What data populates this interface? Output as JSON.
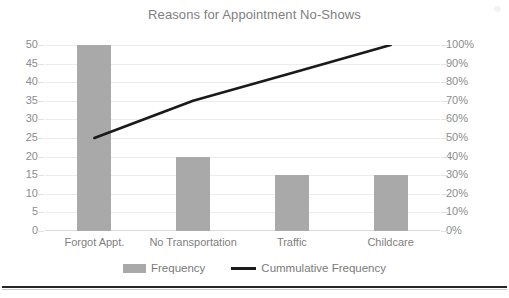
{
  "chart_data": {
    "type": "bar",
    "title": "Reasons for Appointment No-Shows",
    "xlabel": "",
    "ylabel": "",
    "categories": [
      "Forgot Appt.",
      "No Transportation",
      "Traffic",
      "Childcare"
    ],
    "series": [
      {
        "name": "Frequency",
        "type": "bar",
        "axis": "left",
        "values": [
          50,
          20,
          15,
          15
        ],
        "color": "#a9a9a9"
      },
      {
        "name": "Cummulative Frequency",
        "type": "line",
        "axis": "right",
        "values": [
          50,
          70,
          85,
          100
        ],
        "value_labels": [
          "50%",
          "70%",
          "85%",
          "100%"
        ],
        "color": "#1a1a1a"
      }
    ],
    "left_axis": {
      "min": 0,
      "max": 50,
      "step": 5,
      "ticks": [
        "50",
        "45",
        "40",
        "35",
        "30",
        "25",
        "20",
        "15",
        "10",
        "5",
        "0"
      ]
    },
    "right_axis": {
      "min": 0,
      "max": 100,
      "step": 10,
      "ticks": [
        "100%",
        "90%",
        "80%",
        "70%",
        "60%",
        "50%",
        "40%",
        "30%",
        "20%",
        "10%",
        "0%"
      ]
    },
    "grid": true,
    "legend_position": "bottom",
    "legend": [
      "Frequency",
      "Cummulative Frequency"
    ]
  },
  "colors": {
    "bar": "#a9a9a9",
    "line": "#1a1a1a",
    "grid": "#ececec",
    "title_text": "#808080",
    "axis_text": "#8c8c8c",
    "category_text": "#7f7f7f",
    "legend_text": "#7a7a7a",
    "background": "#ffffff"
  }
}
